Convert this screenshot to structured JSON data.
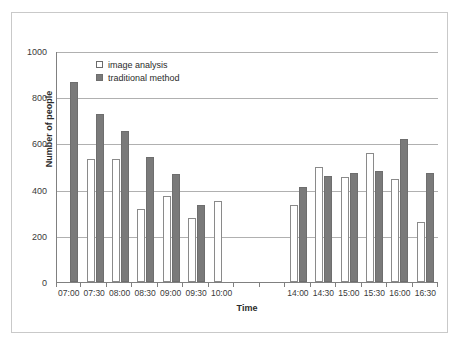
{
  "chart_data": {
    "type": "bar",
    "title": "",
    "xlabel": "Time",
    "ylabel": "Number of people",
    "ylim": [
      0,
      1000
    ],
    "yticks": [
      0,
      200,
      400,
      600,
      800,
      1000
    ],
    "grid": true,
    "legend_position": "top-left-inside",
    "categories": [
      "07:00",
      "07:30",
      "08:00",
      "08:30",
      "09:00",
      "09:30",
      "10:00",
      "",
      "",
      "14:00",
      "14:30",
      "15:00",
      "15:30",
      "16:00",
      "16:30"
    ],
    "series": [
      {
        "name": "image analysis",
        "color": "#ffffff",
        "values": [
          null,
          533,
          533,
          317,
          372,
          275,
          350,
          null,
          null,
          333,
          500,
          453,
          558,
          448,
          260
        ]
      },
      {
        "name": "traditional method",
        "color": "#7a7a7a",
        "values": [
          866,
          728,
          653,
          540,
          466,
          335,
          null,
          null,
          null,
          412,
          457,
          470,
          482,
          618,
          473
        ]
      }
    ]
  },
  "axes": {
    "y_tick_labels": [
      "1000",
      "800",
      "600",
      "400",
      "200",
      "0"
    ],
    "y_axis_title": "Number of people",
    "x_axis_title": "Time",
    "x_tick_labels": [
      "07:00",
      "07:30",
      "08:00",
      "08:30",
      "09:00",
      "09:30",
      "10:00",
      "",
      "",
      "14:00",
      "14:30",
      "15:00",
      "15:30",
      "16:00",
      "16:30"
    ]
  },
  "legend": {
    "items": [
      {
        "label": "image analysis",
        "swatch": "hollow-square-icon"
      },
      {
        "label": "traditional method",
        "swatch": "filled-square-icon"
      }
    ]
  }
}
